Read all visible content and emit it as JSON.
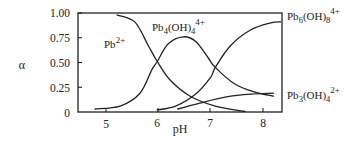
{
  "chart_data": {
    "type": "line",
    "title": "",
    "xlabel": "pH",
    "ylabel": "α",
    "xlim": [
      4.46,
      8.38
    ],
    "ylim": [
      0,
      1.0
    ],
    "grid": false,
    "legend_position": "inline labels next to curves",
    "x_ticks": [
      5,
      6,
      7,
      8
    ],
    "x_tick_labels": [
      "5",
      "6",
      "7",
      "8"
    ],
    "y_ticks": [
      0,
      0.25,
      0.5,
      0.75,
      1.0
    ],
    "y_tick_labels": [
      "0",
      "0.25",
      "0.50",
      "0.75",
      "1.00"
    ],
    "series": [
      {
        "name": "Pb2+",
        "label_main": "Pb",
        "label_sup": "2+",
        "x": [
          5.21,
          5.55,
          5.8,
          5.98,
          6.23,
          6.61,
          7.09,
          7.66
        ],
        "y": [
          0.98,
          0.91,
          0.68,
          0.51,
          0.32,
          0.16,
          0.06,
          0.005
        ]
      },
      {
        "name": "Pb4(OH)4 4+",
        "label_main": "Pb",
        "label_sub1": "4",
        "label_mid": "(OH)",
        "label_sub2": "4",
        "label_sup": "4+",
        "x": [
          4.79,
          5.27,
          5.65,
          5.88,
          5.98,
          6.19,
          6.48,
          6.72,
          6.95,
          7.09,
          7.47,
          7.85,
          8.2
        ],
        "y": [
          0.03,
          0.06,
          0.19,
          0.43,
          0.51,
          0.69,
          0.76,
          0.71,
          0.55,
          0.45,
          0.28,
          0.2,
          0.16
        ]
      },
      {
        "name": "Pb6(OH)8 4+",
        "label_main": "Pb",
        "label_sub1": "6",
        "label_mid": "(OH)",
        "label_sub2": "8",
        "label_sup": "4+",
        "x": [
          5.98,
          6.33,
          6.71,
          7.0,
          7.09,
          7.38,
          7.77,
          8.15,
          8.34
        ],
        "y": [
          0.02,
          0.06,
          0.18,
          0.35,
          0.45,
          0.67,
          0.83,
          0.9,
          0.91
        ]
      },
      {
        "name": "Pb3(OH)4 2+",
        "label_main": "Pb",
        "label_sub1": "3",
        "label_mid": "(OH)",
        "label_sub2": "4",
        "label_sup": "2+",
        "x": [
          6.37,
          6.8,
          7.28,
          7.77,
          8.2
        ],
        "y": [
          0.03,
          0.09,
          0.15,
          0.18,
          0.19
        ]
      }
    ]
  },
  "axes": {
    "ylabel": "α",
    "xlabel": "pH"
  }
}
